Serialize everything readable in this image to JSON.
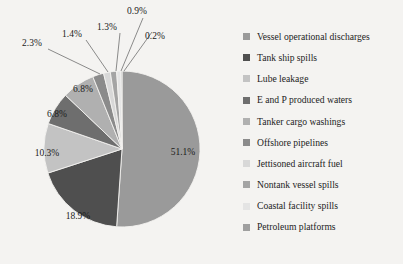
{
  "background_color": "#f4f3f1",
  "chart_data": {
    "type": "pie",
    "title": "",
    "subtitle": "",
    "xlabel": "",
    "ylabel": "",
    "grid": false,
    "legend_position": "right",
    "start_angle_clock": "12 o'clock",
    "direction": "clockwise",
    "units": "percent",
    "total": 100.0,
    "categories": [
      "Vessel operational discharges",
      "Tank ship spills",
      "Lube leakage",
      "E and P produced waters",
      "Tanker cargo washings",
      "Offshore pipelines",
      "Jettisoned aircraft fuel",
      "Nontank vessel spills",
      "Coastal facility spills",
      "Petroleum platforms"
    ],
    "values": [
      51.1,
      18.9,
      10.3,
      6.8,
      6.8,
      2.3,
      1.4,
      1.3,
      0.9,
      0.2
    ],
    "value_labels": [
      "51.1%",
      "18.9%",
      "10.3%",
      "6.8%",
      "6.8%",
      "2.3%",
      "1.4%",
      "1.3%",
      "0.9%",
      "0.2%"
    ],
    "colors": [
      "#9a9a9a",
      "#4f4f4f",
      "#c3c3c3",
      "#6e6e6e",
      "#b0b0b0",
      "#8b8b8b",
      "#d8d8d8",
      "#a4a4a4",
      "#e4e4e4",
      "#9f9f9f"
    ],
    "label_placement": [
      "inside",
      "inside",
      "inside",
      "inside",
      "inside",
      "callout",
      "callout",
      "callout",
      "callout",
      "callout"
    ]
  },
  "pie": {
    "center_x": 122,
    "center_y": 149,
    "radius": 78,
    "inside_labels": [
      {
        "text": "51.1%",
        "x": 183,
        "y": 155
      },
      {
        "text": "18.9%",
        "x": 78,
        "y": 219
      },
      {
        "text": "10.3%",
        "x": 47,
        "y": 156
      },
      {
        "text": "6.8%",
        "x": 57,
        "y": 117
      },
      {
        "text": "6.8%",
        "x": 83,
        "y": 92
      }
    ],
    "callouts": [
      {
        "text": "2.3%",
        "x": 22,
        "y": 46,
        "lx1": 48,
        "ly1": 49,
        "lx2": 100,
        "ly2": 74
      },
      {
        "text": "1.4%",
        "x": 62,
        "y": 37,
        "lx1": 86,
        "ly1": 40,
        "lx2": 108,
        "ly2": 72
      },
      {
        "text": "1.3%",
        "x": 97,
        "y": 30,
        "lx1": 120,
        "ly1": 33,
        "lx2": 116,
        "ly2": 71
      },
      {
        "text": "0.9%",
        "x": 127,
        "y": 14,
        "lx1": 143,
        "ly1": 18,
        "lx2": 121,
        "ly2": 71
      },
      {
        "text": "0.2%",
        "x": 145,
        "y": 39,
        "lx1": 152,
        "ly1": 32,
        "lx2": 124,
        "ly2": 71
      }
    ]
  },
  "legend": {
    "items": [
      {
        "label": "Vessel operational discharges",
        "color": "#9a9a9a"
      },
      {
        "label": "Tank ship spills",
        "color": "#4f4f4f"
      },
      {
        "label": "Lube leakage",
        "color": "#c3c3c3"
      },
      {
        "label": "E and P produced waters",
        "color": "#6e6e6e"
      },
      {
        "label": "Tanker cargo washings",
        "color": "#b0b0b0"
      },
      {
        "label": "Offshore pipelines",
        "color": "#8b8b8b"
      },
      {
        "label": "Jettisoned aircraft fuel",
        "color": "#d8d8d8"
      },
      {
        "label": "Nontank vessel spills",
        "color": "#a4a4a4"
      },
      {
        "label": "Coastal facility spills",
        "color": "#e4e4e4"
      },
      {
        "label": "Petroleum platforms",
        "color": "#9f9f9f"
      }
    ]
  }
}
